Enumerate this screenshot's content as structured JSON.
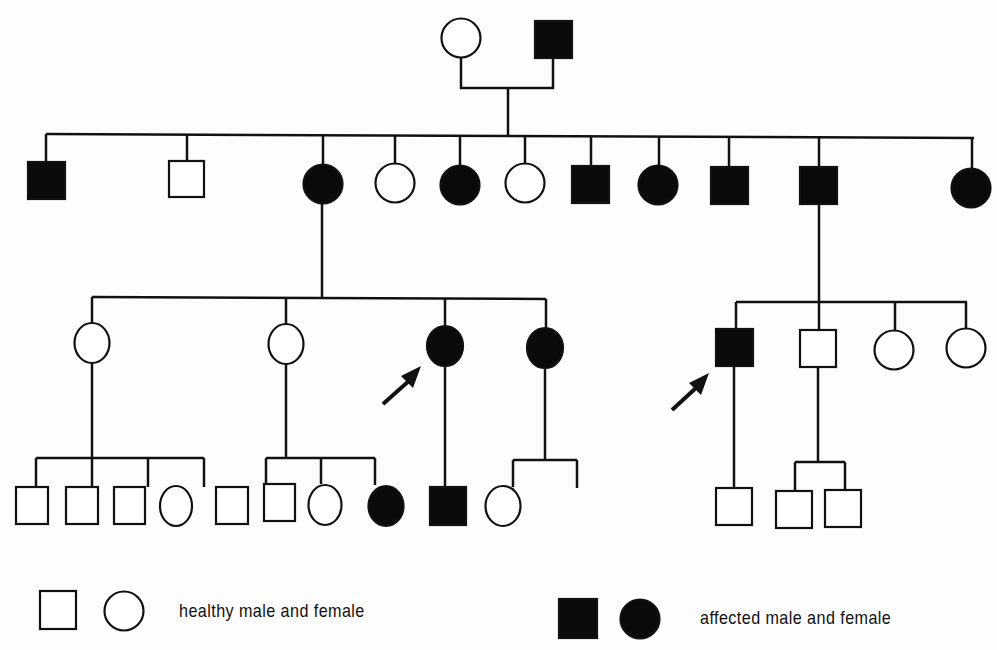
{
  "colors": {
    "line": "#111111",
    "affected": "#0a0a0a",
    "healthy_fill": "#ffffff"
  },
  "generations": [
    {
      "label": "I",
      "individuals": [
        {
          "id": "I-1",
          "sex": "female",
          "affected": false
        },
        {
          "id": "I-2",
          "sex": "male",
          "affected": true
        }
      ]
    },
    {
      "label": "II",
      "individuals": [
        {
          "id": "II-1",
          "sex": "male",
          "affected": true
        },
        {
          "id": "II-2",
          "sex": "male",
          "affected": false
        },
        {
          "id": "II-3",
          "sex": "female",
          "affected": true
        },
        {
          "id": "II-4",
          "sex": "female",
          "affected": false
        },
        {
          "id": "II-5",
          "sex": "female",
          "affected": true
        },
        {
          "id": "II-6",
          "sex": "female",
          "affected": false
        },
        {
          "id": "II-7",
          "sex": "male",
          "affected": true
        },
        {
          "id": "II-8",
          "sex": "female",
          "affected": true
        },
        {
          "id": "II-9",
          "sex": "male",
          "affected": true
        },
        {
          "id": "II-10",
          "sex": "male",
          "affected": true
        },
        {
          "id": "II-11",
          "sex": "female",
          "affected": true
        }
      ]
    },
    {
      "label": "III",
      "individuals": [
        {
          "id": "III-1",
          "sex": "female",
          "affected": false,
          "parent": "II-3"
        },
        {
          "id": "III-2",
          "sex": "female",
          "affected": false,
          "parent": "II-3"
        },
        {
          "id": "III-3",
          "sex": "female",
          "affected": true,
          "parent": "II-3",
          "proband": true
        },
        {
          "id": "III-4",
          "sex": "female",
          "affected": true,
          "parent": "II-3"
        },
        {
          "id": "III-5",
          "sex": "male",
          "affected": true,
          "parent": "II-10",
          "proband": true
        },
        {
          "id": "III-6",
          "sex": "male",
          "affected": false,
          "parent": "II-10"
        },
        {
          "id": "III-7",
          "sex": "female",
          "affected": false,
          "parent": "II-10"
        },
        {
          "id": "III-8",
          "sex": "female",
          "affected": false,
          "parent": "II-10"
        }
      ]
    },
    {
      "label": "IV",
      "individuals": [
        {
          "id": "IV-1",
          "sex": "male",
          "affected": false,
          "parent": "III-1"
        },
        {
          "id": "IV-2",
          "sex": "male",
          "affected": false,
          "parent": "III-1"
        },
        {
          "id": "IV-3",
          "sex": "male",
          "affected": false,
          "parent": "III-1"
        },
        {
          "id": "IV-4",
          "sex": "female",
          "affected": false,
          "parent": "III-1"
        },
        {
          "id": "IV-5",
          "sex": "male",
          "affected": false,
          "parent": "III-2"
        },
        {
          "id": "IV-6",
          "sex": "male",
          "affected": false,
          "parent": "III-2"
        },
        {
          "id": "IV-7",
          "sex": "female",
          "affected": false,
          "parent": "III-2"
        },
        {
          "id": "IV-8",
          "sex": "female",
          "affected": true,
          "parent": "III-3"
        },
        {
          "id": "IV-9",
          "sex": "male",
          "affected": true,
          "parent": "III-4"
        },
        {
          "id": "IV-10",
          "sex": "female",
          "affected": false,
          "parent": "III-4"
        },
        {
          "id": "IV-11",
          "sex": "male",
          "affected": false,
          "parent": "III-5"
        },
        {
          "id": "IV-12",
          "sex": "male",
          "affected": false,
          "parent": "III-6"
        },
        {
          "id": "IV-13",
          "sex": "male",
          "affected": false,
          "parent": "III-6"
        }
      ]
    }
  ],
  "legend": {
    "healthy_label": "healthy male and female",
    "affected_label": "affected male and female"
  }
}
